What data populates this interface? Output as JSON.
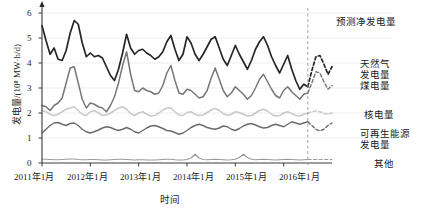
{
  "chart_data": {
    "type": "line",
    "title": "",
    "xlabel": "时间",
    "ylabel": "发电量/(10⁸ MW·h/d)",
    "ylim": [
      0,
      6.4
    ],
    "yticks": [
      0,
      1,
      2,
      3,
      4,
      5,
      6
    ],
    "ytick_labels": [
      "0",
      "1",
      "2",
      "3",
      "4",
      "5",
      "6"
    ],
    "grid": true,
    "legend_position": "right",
    "xlim": [
      2011.0,
      2017.0
    ],
    "xticks": [
      2011,
      2012,
      2013,
      2014,
      2015,
      2016
    ],
    "xtick_labels": [
      "2011年1月",
      "2012年1月",
      "2013年1月",
      "2014年1月",
      "2015年1月",
      "2016年1月"
    ],
    "forecast_start": 2016.5,
    "forecast_divider_label": "预测净发电量",
    "series": [
      {
        "name": "总净发电量",
        "legend_label": "预测净发电量",
        "color": "#262626",
        "width": 1.7,
        "x": [
          2011.0,
          2011.083,
          2011.167,
          2011.25,
          2011.333,
          2011.417,
          2011.5,
          2011.583,
          2011.667,
          2011.75,
          2011.833,
          2011.917,
          2012.0,
          2012.083,
          2012.167,
          2012.25,
          2012.333,
          2012.417,
          2012.5,
          2012.583,
          2012.667,
          2012.75,
          2012.833,
          2012.917,
          2013.0,
          2013.083,
          2013.167,
          2013.25,
          2013.333,
          2013.417,
          2013.5,
          2013.583,
          2013.667,
          2013.75,
          2013.833,
          2013.917,
          2014.0,
          2014.083,
          2014.167,
          2014.25,
          2014.333,
          2014.417,
          2014.5,
          2014.583,
          2014.667,
          2014.75,
          2014.833,
          2014.917,
          2015.0,
          2015.083,
          2015.167,
          2015.25,
          2015.333,
          2015.417,
          2015.5,
          2015.583,
          2015.667,
          2015.75,
          2015.833,
          2015.917,
          2016.0,
          2016.083,
          2016.167,
          2016.25,
          2016.333,
          2016.417,
          2016.5
        ],
        "values": [
          5.5,
          4.9,
          4.35,
          4.6,
          4.15,
          4.1,
          4.5,
          5.2,
          5.7,
          5.55,
          4.8,
          4.25,
          4.4,
          4.25,
          4.3,
          4.2,
          3.85,
          3.5,
          3.3,
          3.75,
          4.4,
          5.15,
          4.6,
          4.35,
          4.5,
          4.55,
          4.4,
          4.3,
          4.15,
          4.25,
          4.45,
          4.85,
          5.1,
          4.55,
          4.1,
          4.35,
          5.05,
          4.8,
          4.35,
          4.1,
          4.35,
          4.65,
          4.95,
          5.05,
          4.6,
          4.15,
          3.9,
          4.3,
          4.7,
          4.35,
          4.05,
          3.75,
          4.1,
          4.55,
          4.85,
          5.05,
          4.7,
          4.25,
          3.9,
          3.6,
          3.95,
          4.3,
          3.75,
          3.3,
          2.95,
          3.15,
          3.05
        ]
      },
      {
        "name": "预测净发电量",
        "legend_label": "预测净发电量",
        "color": "#262626",
        "width": 1.7,
        "dashed": true,
        "x": [
          2016.5,
          2016.583,
          2016.667,
          2016.75,
          2016.833,
          2016.917,
          2017.0
        ],
        "values": [
          3.05,
          3.7,
          4.25,
          4.3,
          3.95,
          3.55,
          3.85
        ]
      },
      {
        "name": "天然气发电量",
        "legend_label": "天然气发电量",
        "color": "#777777",
        "width": 1.5,
        "x": [
          2011.0,
          2011.083,
          2011.167,
          2011.25,
          2011.333,
          2011.417,
          2011.5,
          2011.583,
          2011.667,
          2011.75,
          2011.833,
          2011.917,
          2012.0,
          2012.083,
          2012.167,
          2012.25,
          2012.333,
          2012.417,
          2012.5,
          2012.583,
          2012.667,
          2012.75,
          2012.833,
          2012.917,
          2013.0,
          2013.083,
          2013.167,
          2013.25,
          2013.333,
          2013.417,
          2013.5,
          2013.583,
          2013.667,
          2013.75,
          2013.833,
          2013.917,
          2014.0,
          2014.083,
          2014.167,
          2014.25,
          2014.333,
          2014.417,
          2014.5,
          2014.583,
          2014.667,
          2014.75,
          2014.833,
          2014.917,
          2015.0,
          2015.083,
          2015.167,
          2015.25,
          2015.333,
          2015.417,
          2015.5,
          2015.583,
          2015.667,
          2015.75,
          2015.833,
          2015.917,
          2016.0,
          2016.083,
          2016.167,
          2016.25,
          2016.333,
          2016.417,
          2016.5
        ],
        "values": [
          2.3,
          2.25,
          2.1,
          2.3,
          2.4,
          2.6,
          3.2,
          3.8,
          3.85,
          3.2,
          2.55,
          2.2,
          2.4,
          2.35,
          2.25,
          2.2,
          2.05,
          2.3,
          2.65,
          3.2,
          3.9,
          4.45,
          3.55,
          2.9,
          2.85,
          3.0,
          2.9,
          2.85,
          2.75,
          2.8,
          3.1,
          3.6,
          3.9,
          3.3,
          2.8,
          2.75,
          2.95,
          2.9,
          2.75,
          2.6,
          2.65,
          2.9,
          3.4,
          3.8,
          3.35,
          2.9,
          2.65,
          2.8,
          3.05,
          2.9,
          2.75,
          2.55,
          2.7,
          3.0,
          3.35,
          3.55,
          3.25,
          2.95,
          2.7,
          2.6,
          2.9,
          3.05,
          2.85,
          2.7,
          2.55,
          2.75,
          2.8
        ]
      },
      {
        "name": "煤电量",
        "legend_label": "煤电量",
        "color": "#777777",
        "width": 1.5,
        "x": [
          2016.5,
          2016.583,
          2016.667,
          2016.75,
          2016.833,
          2016.917,
          2017.0
        ],
        "values": [
          2.8,
          3.2,
          3.65,
          3.6,
          3.25,
          2.95,
          3.1
        ],
        "dashed": true
      },
      {
        "name": "核电量",
        "legend_label": "核电量",
        "color": "#c9c9c9",
        "width": 1.5,
        "x": [
          2011.0,
          2011.083,
          2011.167,
          2011.25,
          2011.333,
          2011.417,
          2011.5,
          2011.583,
          2011.667,
          2011.75,
          2011.833,
          2011.917,
          2012.0,
          2012.083,
          2012.167,
          2012.25,
          2012.333,
          2012.417,
          2012.5,
          2012.583,
          2012.667,
          2012.75,
          2012.833,
          2012.917,
          2013.0,
          2013.083,
          2013.167,
          2013.25,
          2013.333,
          2013.417,
          2013.5,
          2013.583,
          2013.667,
          2013.75,
          2013.833,
          2013.917,
          2014.0,
          2014.083,
          2014.167,
          2014.25,
          2014.333,
          2014.417,
          2014.5,
          2014.583,
          2014.667,
          2014.75,
          2014.833,
          2014.917,
          2015.0,
          2015.083,
          2015.167,
          2015.25,
          2015.333,
          2015.417,
          2015.5,
          2015.583,
          2015.667,
          2015.75,
          2015.833,
          2015.917,
          2016.0,
          2016.083,
          2016.167,
          2016.25,
          2016.333,
          2016.417,
          2016.5
        ],
        "values": [
          2.1,
          2.05,
          1.95,
          1.9,
          1.95,
          2.05,
          2.15,
          2.2,
          2.25,
          2.1,
          1.95,
          1.9,
          2.05,
          2.1,
          2.0,
          1.9,
          1.92,
          2.0,
          2.1,
          2.2,
          2.25,
          2.15,
          1.98,
          1.9,
          2.0,
          2.05,
          1.95,
          1.88,
          1.9,
          2.0,
          2.12,
          2.2,
          2.2,
          2.05,
          1.92,
          1.9,
          2.02,
          2.05,
          1.95,
          1.9,
          1.92,
          2.02,
          2.12,
          2.18,
          2.1,
          1.98,
          1.9,
          1.95,
          2.05,
          2.02,
          1.95,
          1.88,
          1.9,
          2.0,
          2.1,
          2.15,
          2.08,
          1.95,
          1.88,
          1.9,
          2.0,
          2.05,
          1.98,
          1.9,
          1.88,
          1.95,
          2.0
        ]
      },
      {
        "name": "核电量预测",
        "legend_label": "核电量",
        "color": "#c9c9c9",
        "width": 1.5,
        "dashed": true,
        "x": [
          2016.5,
          2016.583,
          2016.667,
          2016.75,
          2016.833,
          2016.917,
          2017.0
        ],
        "values": [
          2.0,
          2.05,
          2.08,
          2.05,
          1.98,
          1.95,
          2.0
        ]
      },
      {
        "name": "可再生能源发电量",
        "legend_label": "可再生能源发电量",
        "color": "#6b6b6b",
        "width": 1.4,
        "x": [
          2011.0,
          2011.083,
          2011.167,
          2011.25,
          2011.333,
          2011.417,
          2011.5,
          2011.583,
          2011.667,
          2011.75,
          2011.833,
          2011.917,
          2012.0,
          2012.083,
          2012.167,
          2012.25,
          2012.333,
          2012.417,
          2012.5,
          2012.583,
          2012.667,
          2012.75,
          2012.833,
          2012.917,
          2013.0,
          2013.083,
          2013.167,
          2013.25,
          2013.333,
          2013.417,
          2013.5,
          2013.583,
          2013.667,
          2013.75,
          2013.833,
          2013.917,
          2014.0,
          2014.083,
          2014.167,
          2014.25,
          2014.333,
          2014.417,
          2014.5,
          2014.583,
          2014.667,
          2014.75,
          2014.833,
          2014.917,
          2015.0,
          2015.083,
          2015.167,
          2015.25,
          2015.333,
          2015.417,
          2015.5,
          2015.583,
          2015.667,
          2015.75,
          2015.833,
          2015.917,
          2016.0,
          2016.083,
          2016.167,
          2016.25,
          2016.333,
          2016.417,
          2016.5
        ],
        "values": [
          1.2,
          1.35,
          1.5,
          1.6,
          1.62,
          1.55,
          1.5,
          1.58,
          1.6,
          1.5,
          1.35,
          1.25,
          1.2,
          1.25,
          1.32,
          1.4,
          1.45,
          1.42,
          1.35,
          1.3,
          1.35,
          1.42,
          1.35,
          1.25,
          1.2,
          1.3,
          1.4,
          1.48,
          1.5,
          1.45,
          1.38,
          1.3,
          1.28,
          1.22,
          1.15,
          1.2,
          1.3,
          1.42,
          1.5,
          1.55,
          1.5,
          1.42,
          1.38,
          1.35,
          1.4,
          1.48,
          1.45,
          1.35,
          1.3,
          1.38,
          1.48,
          1.55,
          1.58,
          1.52,
          1.45,
          1.4,
          1.42,
          1.5,
          1.55,
          1.5,
          1.45,
          1.55,
          1.65,
          1.6,
          1.55,
          1.6,
          1.65
        ]
      },
      {
        "name": "可再生能源发电量预测",
        "legend_label": "可再生能源发电量",
        "color": "#6b6b6b",
        "width": 1.4,
        "dashed": true,
        "x": [
          2016.5,
          2016.583,
          2016.667,
          2016.75,
          2016.833,
          2016.917,
          2017.0
        ],
        "values": [
          1.65,
          1.5,
          1.35,
          1.28,
          1.35,
          1.5,
          1.6
        ]
      },
      {
        "name": "其他",
        "legend_label": "其他",
        "color": "#9a9a9a",
        "width": 1.2,
        "x": [
          2011.0,
          2011.083,
          2011.167,
          2011.25,
          2011.333,
          2011.417,
          2011.5,
          2011.583,
          2011.667,
          2011.75,
          2011.833,
          2011.917,
          2012.0,
          2012.083,
          2012.167,
          2012.25,
          2012.333,
          2012.417,
          2012.5,
          2012.583,
          2012.667,
          2012.75,
          2012.833,
          2012.917,
          2013.0,
          2013.083,
          2013.167,
          2013.25,
          2013.333,
          2013.417,
          2013.5,
          2013.583,
          2013.667,
          2013.75,
          2013.833,
          2013.917,
          2014.0,
          2014.083,
          2014.167,
          2014.25,
          2014.333,
          2014.417,
          2014.5,
          2014.583,
          2014.667,
          2014.75,
          2014.833,
          2014.917,
          2015.0,
          2015.083,
          2015.167,
          2015.25,
          2015.333,
          2015.417,
          2015.5,
          2015.583,
          2015.667,
          2015.75,
          2015.833,
          2015.917,
          2016.0,
          2016.083,
          2016.167,
          2016.25,
          2016.333,
          2016.417,
          2016.5
        ],
        "values": [
          0.16,
          0.15,
          0.14,
          0.13,
          0.13,
          0.14,
          0.15,
          0.16,
          0.16,
          0.14,
          0.13,
          0.13,
          0.14,
          0.14,
          0.13,
          0.12,
          0.12,
          0.13,
          0.14,
          0.15,
          0.15,
          0.14,
          0.13,
          0.12,
          0.13,
          0.13,
          0.12,
          0.12,
          0.12,
          0.13,
          0.14,
          0.15,
          0.15,
          0.13,
          0.12,
          0.12,
          0.14,
          0.2,
          0.35,
          0.2,
          0.14,
          0.13,
          0.14,
          0.15,
          0.14,
          0.13,
          0.12,
          0.13,
          0.15,
          0.22,
          0.35,
          0.22,
          0.15,
          0.13,
          0.14,
          0.15,
          0.14,
          0.13,
          0.12,
          0.13,
          0.14,
          0.15,
          0.14,
          0.13,
          0.12,
          0.13,
          0.14
        ]
      },
      {
        "name": "其他预测",
        "legend_label": "其他",
        "color": "#9a9a9a",
        "width": 1.2,
        "dashed": true,
        "x": [
          2016.5,
          2016.583,
          2016.667,
          2016.75,
          2016.833,
          2016.917,
          2017.0
        ],
        "values": [
          0.14,
          0.14,
          0.14,
          0.14,
          0.14,
          0.14,
          0.14
        ]
      }
    ],
    "legend": [
      {
        "label": "预测净发电量",
        "color": "#262626"
      },
      {
        "label": "天然气",
        "color": "#777777"
      },
      {
        "label": "发电量",
        "color": "#777777"
      },
      {
        "label": "煤电量",
        "color": "#777777"
      },
      {
        "label": "核电量",
        "color": "#c9c9c9"
      },
      {
        "label": "可再生能源",
        "color": "#6b6b6b"
      },
      {
        "label": "发电量",
        "color": "#6b6b6b"
      },
      {
        "label": "其他",
        "color": "#9a9a9a"
      }
    ]
  },
  "axes": {
    "y_title": "发电量/(10⁸ MW·h/d)",
    "x_title": "时间",
    "ytick_0": "0",
    "ytick_1": "1",
    "ytick_2": "2",
    "ytick_3": "3",
    "ytick_4": "4",
    "ytick_5": "5",
    "ytick_6": "6",
    "xtick_0": "2011年1月",
    "xtick_1": "2012年1月",
    "xtick_2": "2013年1月",
    "xtick_3": "2014年1月",
    "xtick_4": "2015年1月",
    "xtick_5": "2016年1月"
  },
  "annotations": {
    "forecast_title": "预测净发电量",
    "gas_line1": "天然气",
    "gas_line2": "发电量",
    "coal": "煤电量",
    "nuclear": "核电量",
    "renewable_line1": "可再生能源",
    "renewable_line2": "发电量",
    "other": "其他"
  }
}
